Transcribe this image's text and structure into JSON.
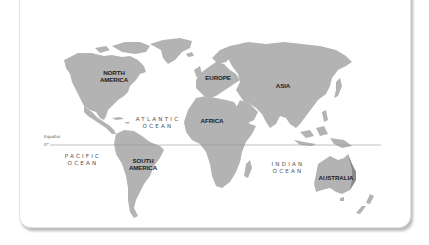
{
  "map": {
    "land_color": "#b3b3b3",
    "equator_color": "#999999",
    "continents": [
      {
        "id": "north-america",
        "label": "NORTH\nAMERICA",
        "line1": "NORTH",
        "line2": "AMERICA"
      },
      {
        "id": "south-america",
        "label": "SOUTH\nAMERICA",
        "line1": "SOUTH",
        "line2": "AMERICA"
      },
      {
        "id": "europe",
        "label": "EUROPE"
      },
      {
        "id": "africa",
        "label": "AFRICA"
      },
      {
        "id": "asia",
        "label": "ASIA"
      },
      {
        "id": "australia",
        "label": "AUSTRALIA"
      }
    ],
    "oceans": [
      {
        "id": "atlantic",
        "line1": "ATLANTIC",
        "line2": "OCEAN"
      },
      {
        "id": "pacific",
        "line1": "PACIFIC",
        "line2": "OCEAN"
      },
      {
        "id": "indian",
        "line1": "INDIAN",
        "line2": "OCEAN"
      }
    ],
    "equator": {
      "label": "Equator",
      "degree": "0°"
    }
  }
}
